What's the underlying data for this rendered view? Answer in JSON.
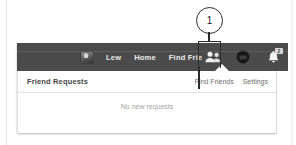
{
  "navbar": {
    "profile_name": "Lew",
    "avatar_icon": "user-avatar-thumbnail",
    "links": [
      {
        "label": "Home",
        "name": "home"
      },
      {
        "label": "Find Friends",
        "name": "find-friends"
      }
    ],
    "icons": [
      {
        "name": "friend-requests-icon",
        "glyph": "two-people"
      },
      {
        "name": "messages-icon",
        "glyph": "filled-circle"
      },
      {
        "name": "notifications-bell-icon",
        "glyph": "bell"
      }
    ],
    "notification_badge": "2"
  },
  "dropdown": {
    "title": "Friend Requests",
    "actions": [
      {
        "label": "Find Friends",
        "name": "find-friends-link"
      },
      {
        "label": "Settings",
        "name": "settings-link"
      }
    ],
    "empty_state": "No new requests"
  },
  "annotation": {
    "number": "1"
  },
  "colors": {
    "navbar_bg": "#4b4b4b",
    "nav_text": "#ededed",
    "panel_bg": "#ffffff",
    "panel_title": "#444444",
    "panel_action": "#6e6e6e",
    "empty_text": "#a6a6a6",
    "annotation": "#2b2b2b"
  }
}
